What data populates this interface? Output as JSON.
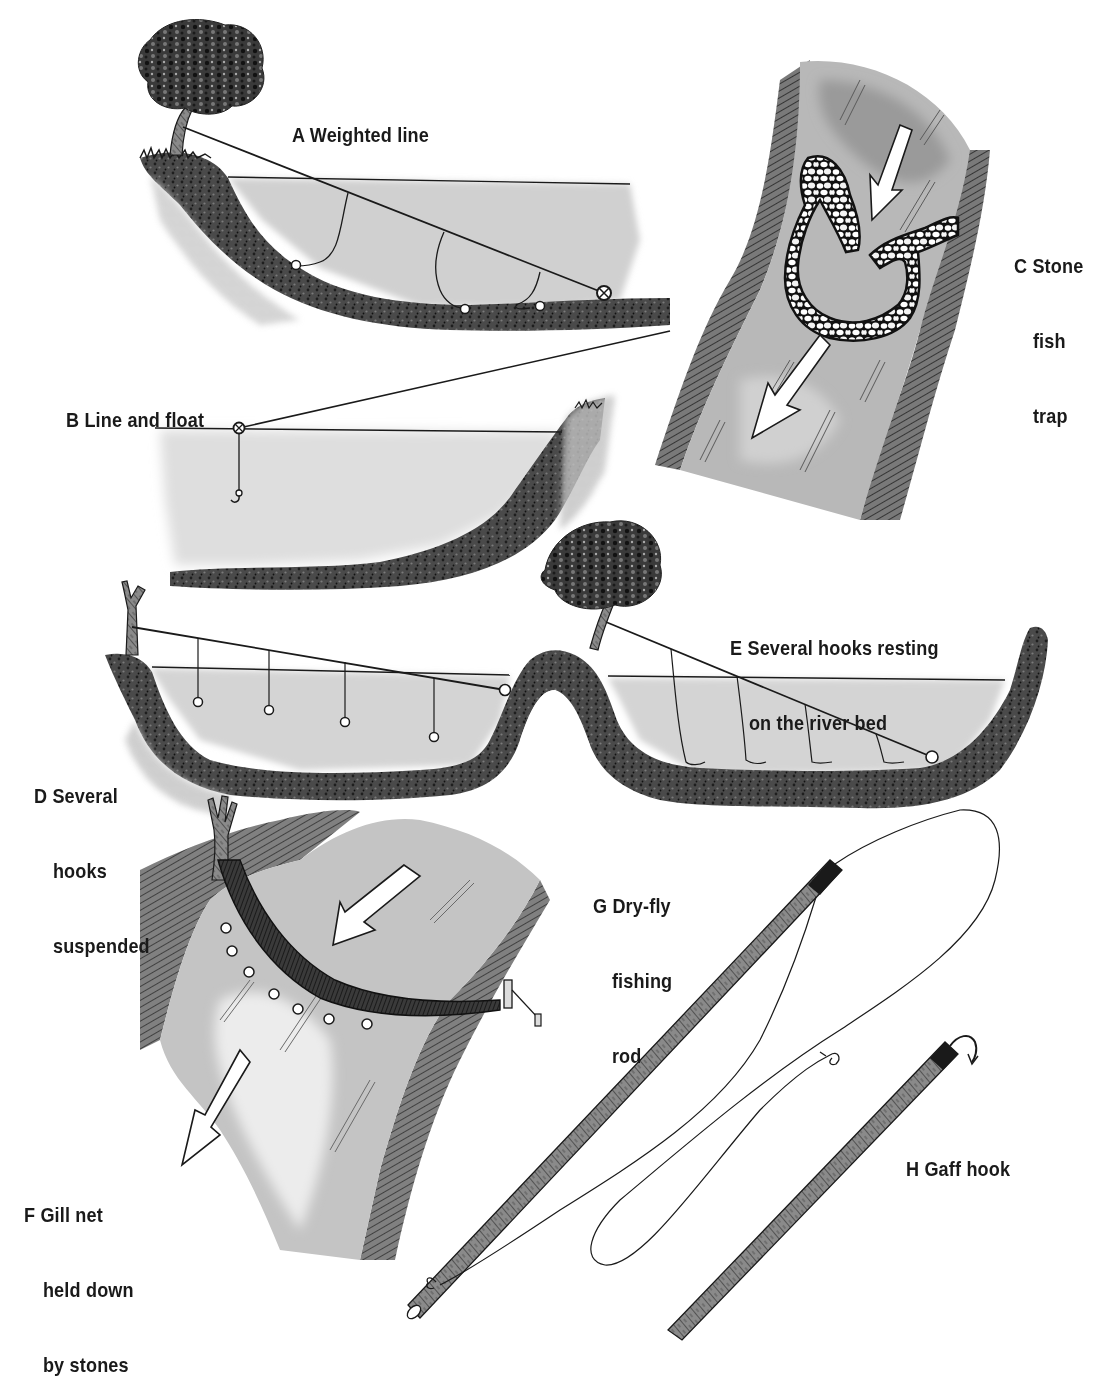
{
  "figure": {
    "colors": {
      "ink": "#1a1a1a",
      "water": "#d4d4d4",
      "water_dark": "#b8b8b8",
      "bank": "#3a3a3a",
      "bank_light": "#9a9a9a",
      "background": "#ffffff"
    }
  },
  "labels": {
    "A": {
      "letter": "A",
      "lines": [
        "A Weighted line"
      ]
    },
    "B": {
      "letter": "B",
      "lines": [
        "B Line and float"
      ]
    },
    "C": {
      "letter": "C",
      "lines": [
        "C Stone",
        "fish",
        "trap"
      ]
    },
    "D": {
      "letter": "D",
      "lines": [
        "D Several",
        "hooks",
        "suspended"
      ]
    },
    "E": {
      "letter": "E",
      "lines": [
        "E Several hooks resting",
        "on the river bed"
      ]
    },
    "F": {
      "letter": "F",
      "lines": [
        "F Gill net",
        "held down",
        "by stones"
      ]
    },
    "G": {
      "letter": "G",
      "lines": [
        "G Dry-fly",
        "fishing",
        "rod"
      ]
    },
    "H": {
      "letter": "H",
      "lines": [
        "H Gaff hook"
      ]
    }
  }
}
